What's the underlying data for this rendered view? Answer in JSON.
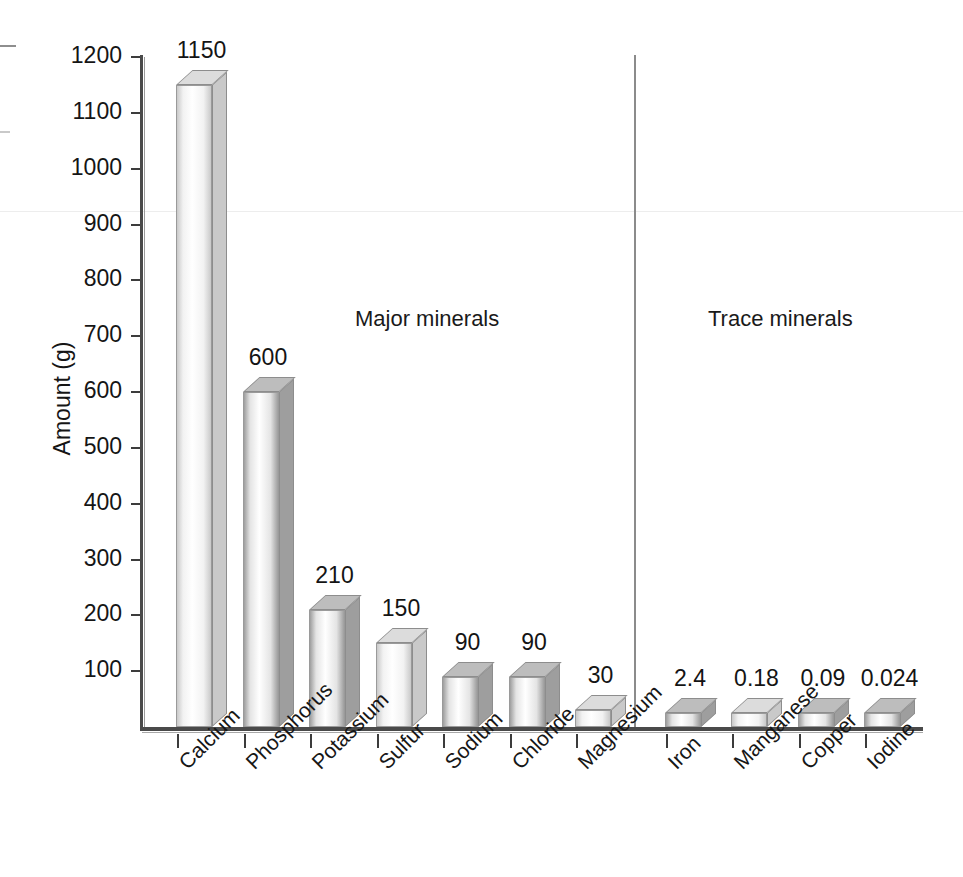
{
  "chart_data": {
    "type": "bar",
    "title": "",
    "xlabel": "",
    "ylabel": "Amount (g)",
    "ylim": [
      0,
      1200
    ],
    "ytick_step": 100,
    "grid": false,
    "legend": null,
    "three_d": true,
    "categories": [
      "Calcium",
      "Phosphorus",
      "Potassium",
      "Sulfur",
      "Sodium",
      "Chloride",
      "Magnesium",
      "Iron",
      "Manganese",
      "Copper",
      "Iodine"
    ],
    "values": [
      1150,
      600,
      210,
      150,
      90,
      90,
      30,
      2.4,
      0.18,
      0.09,
      0.024
    ],
    "value_labels": [
      "1150",
      "600",
      "210",
      "150",
      "90",
      "90",
      "30",
      "2.4",
      "0.18",
      "0.09",
      "0.024"
    ],
    "ytick_labels": [
      "1200",
      "1100",
      "1000",
      "900",
      "800",
      "700",
      "600",
      "500",
      "400",
      "300",
      "200",
      "100"
    ],
    "ytick_values": [
      1200,
      1100,
      1000,
      900,
      800,
      700,
      600,
      500,
      400,
      300,
      200,
      100
    ],
    "annotations": [
      {
        "text": "Major minerals",
        "group": "major"
      },
      {
        "text": "Trace minerals",
        "group": "trace"
      }
    ],
    "groups": [
      {
        "name": "Major minerals",
        "categories": [
          "Calcium",
          "Phosphorus",
          "Potassium",
          "Sulfur",
          "Sodium",
          "Chloride",
          "Magnesium"
        ]
      },
      {
        "name": "Trace minerals",
        "categories": [
          "Iron",
          "Manganese",
          "Copper",
          "Iodine"
        ]
      }
    ],
    "colors": {
      "bar_light_front": "#f2f2f2",
      "bar_light_side": "#c9c9c9",
      "bar_light_top": "#dcdcdc",
      "bar_dark_front": "#e4e4e4",
      "bar_dark_side": "#9e9e9e",
      "bar_dark_top": "#bdbdbd",
      "axis": "#4a4a4a",
      "text": "#151515",
      "divider": "#8b8b8b",
      "background": "#ffffff"
    },
    "bar_shades": [
      "light",
      "dark",
      "dark",
      "light",
      "dark",
      "dark",
      "light",
      "dark",
      "light",
      "dark",
      "dark"
    ]
  }
}
